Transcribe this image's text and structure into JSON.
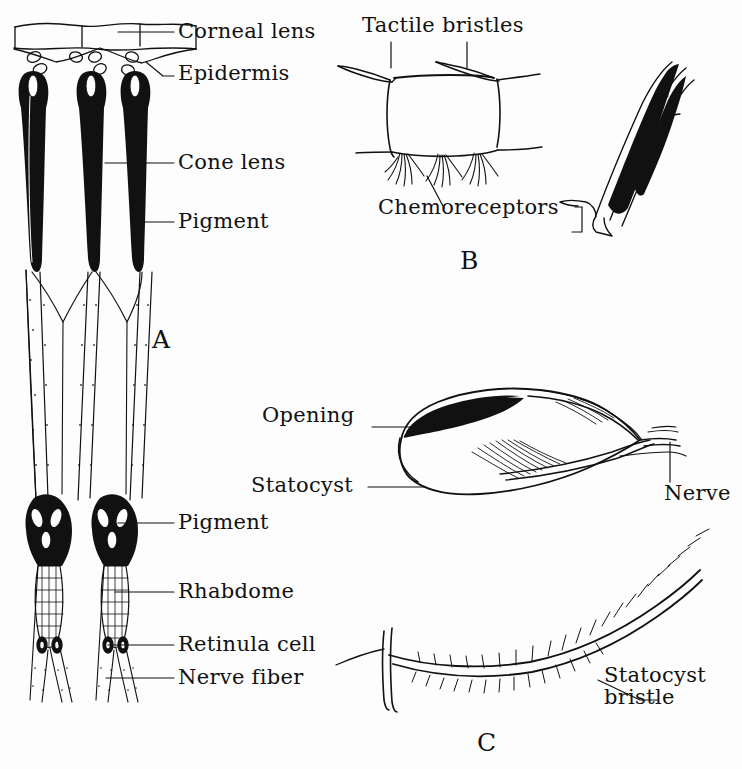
{
  "figure": {
    "background_color": "#fdfdfd",
    "ink_color": "#111111",
    "panels": [
      {
        "id": "A",
        "letter": "A",
        "caption": "Compound eye ommatidia, longitudinal section"
      },
      {
        "id": "B",
        "letter": "B",
        "caption": "Tactile bristles and chemoreceptors on cuticle"
      },
      {
        "id": "C",
        "letter": "C",
        "caption": "Statocyst and statocyst bristle"
      }
    ]
  },
  "labels": {
    "corneal_lens": "Corneal lens",
    "epidermis": "Epidermis",
    "cone_lens": "Cone lens",
    "pigment_upper": "Pigment",
    "pigment_lower": "Pigment",
    "rhabdome": "Rhabdome",
    "retinula_cell": "Retinula cell",
    "nerve_fiber": "Nerve fiber",
    "tactile_bristles": "Tactile bristles",
    "chemoreceptors": "Chemoreceptors",
    "opening": "Opening",
    "statocyst": "Statocyst",
    "nerve": "Nerve",
    "statocyst_bristle_line1": "Statocyst",
    "statocyst_bristle_line2": "bristle",
    "panel_a": "A",
    "panel_b": "B",
    "panel_c": "C"
  }
}
